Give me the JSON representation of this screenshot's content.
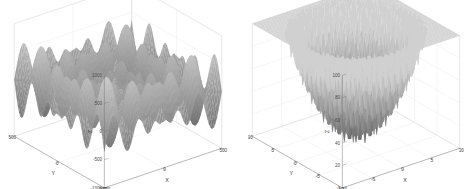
{
  "figure": {
    "background_color": "#ffffff",
    "panel_count": 2,
    "layout": "side-by-side"
  },
  "chart_data": [
    {
      "type": "surface",
      "panel": "left",
      "title": "",
      "xlabel": "X",
      "ylabel": "Y",
      "zlabel": "Z",
      "xlim": [
        -500,
        500
      ],
      "ylim": [
        -500,
        500
      ],
      "zlim": [
        -1000,
        1000
      ],
      "xticks": [
        -500,
        0,
        500
      ],
      "yticks": [
        -500,
        0,
        500
      ],
      "zticks": [
        -1000,
        -500,
        0,
        500,
        1000
      ],
      "xtick_labels": [
        "-500",
        "0",
        "500"
      ],
      "ytick_labels": [
        "-500",
        "0",
        "500"
      ],
      "ztick_labels": [
        "-1000",
        "-500",
        "0",
        "500",
        "1000"
      ],
      "grid": true,
      "legend": "none",
      "colormap": "grayscale",
      "color_low": "#5e5e5e",
      "color_high": "#cfcfcf",
      "function": "schwefel",
      "description": "Highly multimodal oscillating surface with many sharp peaks and valleys spanning the full Z range",
      "surface_min": -1000,
      "surface_max": 900,
      "view_azimuth": -37.5,
      "view_elevation": 30
    },
    {
      "type": "surface",
      "panel": "right",
      "title": "",
      "xlabel": "X",
      "ylabel": "Y",
      "zlabel": "Z",
      "xlim": [
        -10,
        10
      ],
      "ylim": [
        -10,
        10
      ],
      "zlim": [
        0,
        100
      ],
      "xticks": [
        -10,
        -5,
        0,
        5,
        10
      ],
      "yticks": [
        -10,
        -5,
        0,
        5,
        10
      ],
      "zticks": [
        0,
        20,
        40,
        60,
        80,
        100
      ],
      "xtick_labels": [
        "-10",
        "-5",
        "0",
        "5",
        "10"
      ],
      "ytick_labels": [
        "-10",
        "-5",
        "0",
        "5",
        "10"
      ],
      "ztick_labels": [
        "0",
        "20",
        "40",
        "60",
        "80",
        "100"
      ],
      "grid": true,
      "legend": "none",
      "colormap": "grayscale",
      "color_low": "#5a5a5a",
      "color_high": "#d0d0d0",
      "function": "rastrigin",
      "description": "Bowl-shaped multimodal surface with regular sinusoidal ripples rising from a central basin",
      "surface_min": 0,
      "surface_max": 80,
      "view_azimuth": -37.5,
      "view_elevation": 30
    }
  ]
}
